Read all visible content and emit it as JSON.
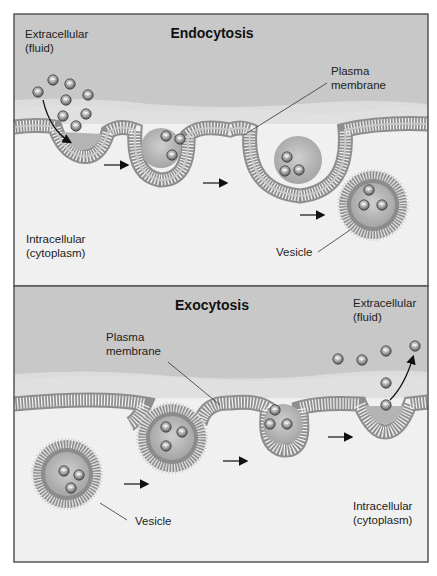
{
  "figure": {
    "panels": [
      {
        "id": "endocytosis",
        "title": "Endocytosis",
        "labels": {
          "extracellular_line1": "Extracellular",
          "extracellular_line2": "(fluid)",
          "membrane_line1": "Plasma",
          "membrane_line2": "membrane",
          "intracellular_line1": "Intracellular",
          "intracellular_line2": "(cytoplasm)",
          "vesicle": "Vesicle"
        },
        "stages": 4
      },
      {
        "id": "exocytosis",
        "title": "Exocytosis",
        "labels": {
          "extracellular_line1": "Extracellular",
          "extracellular_line2": "(fluid)",
          "membrane_line1": "Plasma",
          "membrane_line2": "membrane",
          "intracellular_line1": "Intracellular",
          "intracellular_line2": "(cytoplasm)",
          "vesicle": "Vesicle"
        },
        "stages": 4
      }
    ],
    "colors": {
      "extracellular": "#c9c9c9",
      "membrane_band": "#e2e2e2",
      "intracellular": "#f0f0f0",
      "membrane_head": "#8a8a8a",
      "vesicle_core": "#b5b5b5",
      "border": "#555555"
    }
  }
}
